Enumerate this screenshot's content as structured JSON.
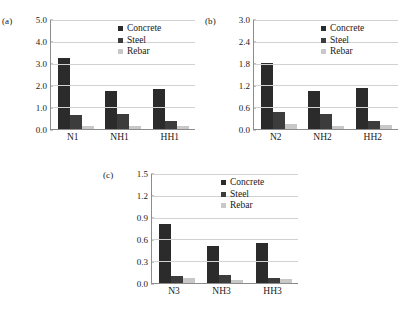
{
  "series_names": [
    "Concrete",
    "Steel",
    "Rebar"
  ],
  "colors": {
    "concrete": "#2b2b2b",
    "steel": "#3c3c3c",
    "rebar": "#c8c8c8",
    "axis": "#8c8c8c",
    "grid": "#d2d2d2",
    "background": "#ffffff"
  },
  "panels": [
    {
      "label": "(a)",
      "categories": [
        "N1",
        "NH1",
        "HH1"
      ],
      "yticks": [
        "5.0",
        "4.0",
        "3.0",
        "2.0",
        "1.0",
        "0.0"
      ],
      "legend": [
        "Concrete",
        "Steel",
        "Rebar"
      ]
    },
    {
      "label": "(b)",
      "categories": [
        "N2",
        "NH2",
        "HH2"
      ],
      "yticks": [
        "3.0",
        "2.4",
        "1.8",
        "1.2",
        "0.6",
        "0.0"
      ],
      "legend": [
        "Concrete",
        "Steel",
        "Rebar"
      ]
    },
    {
      "label": "(c)",
      "categories": [
        "N3",
        "NH3",
        "HH3"
      ],
      "yticks": [
        "1.5",
        "1.2",
        "0.9",
        "0.6",
        "0.3",
        "0.0"
      ],
      "legend": [
        "Concrete",
        "Steel",
        "Rebar"
      ]
    }
  ],
  "chart_data": [
    {
      "type": "bar",
      "title": "(a)",
      "categories": [
        "N1",
        "NH1",
        "HH1"
      ],
      "series": [
        {
          "name": "Concrete",
          "values": [
            3.22,
            1.72,
            1.84
          ]
        },
        {
          "name": "Steel",
          "values": [
            0.64,
            0.67,
            0.38
          ]
        },
        {
          "name": "Rebar",
          "values": [
            0.13,
            0.12,
            0.13
          ]
        }
      ],
      "xlabel": "",
      "ylabel": "",
      "ylim": [
        0.0,
        5.0
      ],
      "ytick_step": 1.0,
      "grid": true,
      "legend_position": "top-right"
    },
    {
      "type": "bar",
      "title": "(b)",
      "categories": [
        "N2",
        "NH2",
        "HH2"
      ],
      "series": [
        {
          "name": "Concrete",
          "values": [
            1.79,
            1.05,
            1.12
          ]
        },
        {
          "name": "Steel",
          "values": [
            0.46,
            0.42,
            0.22
          ]
        },
        {
          "name": "Rebar",
          "values": [
            0.13,
            0.08,
            0.1
          ]
        }
      ],
      "xlabel": "",
      "ylabel": "",
      "ylim": [
        0.0,
        3.0
      ],
      "ytick_step": 0.6,
      "grid": true,
      "legend_position": "top-right"
    },
    {
      "type": "bar",
      "title": "(c)",
      "categories": [
        "N3",
        "NH3",
        "HH3"
      ],
      "series": [
        {
          "name": "Concrete",
          "values": [
            0.81,
            0.51,
            0.54
          ]
        },
        {
          "name": "Steel",
          "values": [
            0.1,
            0.11,
            0.07
          ]
        },
        {
          "name": "Rebar",
          "values": [
            0.07,
            0.04,
            0.05
          ]
        }
      ],
      "xlabel": "",
      "ylabel": "",
      "ylim": [
        0.0,
        1.5
      ],
      "ytick_step": 0.3,
      "grid": true,
      "legend_position": "top-right"
    }
  ]
}
